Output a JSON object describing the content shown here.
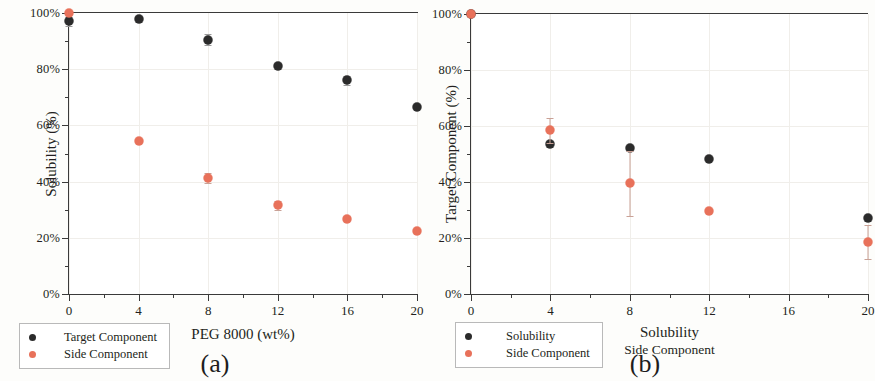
{
  "figure": {
    "panels": [
      {
        "key": "a",
        "caption": "(a)",
        "ylabel": "Solubility (%)",
        "xlabel": "PEG 8000 (wt%)",
        "xlabel_sub": ""
      },
      {
        "key": "b",
        "caption": "(b)",
        "ylabel": "Target Component (%)",
        "xlabel": "Solubility",
        "xlabel_sub": "Side Component"
      }
    ]
  },
  "chart_data": [
    {
      "type": "scatter",
      "panel": "a",
      "title": "",
      "xlabel": "PEG 8000 (wt%)",
      "ylabel": "Solubility (%)",
      "xlim": [
        0,
        20
      ],
      "ylim": [
        0,
        100
      ],
      "xticks": [
        0,
        4,
        8,
        12,
        16,
        20
      ],
      "xticklabels": [
        "0",
        "4",
        "8",
        "12",
        "16",
        "20"
      ],
      "yticks": [
        0,
        20,
        40,
        60,
        80,
        100
      ],
      "yticklabels": [
        "0%",
        "20%",
        "40%",
        "60%",
        "80%",
        "100%"
      ],
      "grid": true,
      "legend_position": "lower-left",
      "x": [
        0,
        4,
        8,
        12,
        16,
        20
      ],
      "series": [
        {
          "name": "Target Component",
          "color": "#2b2b2b",
          "values": [
            97.0,
            97.8,
            90.5,
            81.2,
            76.0,
            66.5
          ],
          "errors": [
            1.5,
            1.0,
            2.0,
            1.0,
            1.5,
            0.8
          ]
        },
        {
          "name": "Side Component",
          "color": "#e8715a",
          "values": [
            100.0,
            54.5,
            41.3,
            31.5,
            26.8,
            22.4
          ],
          "errors": [
            0.8,
            0.8,
            1.8,
            1.5,
            0.8,
            0.8
          ]
        }
      ]
    },
    {
      "type": "scatter",
      "panel": "b",
      "title": "",
      "xlabel": "Solubility",
      "xlabel_sub": "Side Component",
      "ylabel": "Target Component (%)",
      "xlim": [
        0,
        20
      ],
      "ylim": [
        0,
        100
      ],
      "xticks": [
        0,
        4,
        8,
        12,
        16,
        20
      ],
      "xticklabels": [
        "0",
        "4",
        "8",
        "12",
        "16",
        "20"
      ],
      "yticks": [
        0,
        20,
        40,
        60,
        80,
        100
      ],
      "yticklabels": [
        "0%",
        "20%",
        "40%",
        "60%",
        "80%",
        "100%"
      ],
      "grid": true,
      "legend_position": "lower-left",
      "x": [
        0,
        4,
        8,
        12,
        16,
        20
      ],
      "series": [
        {
          "name": "Solubility",
          "color": "#2b2b2b",
          "values": [
            100.0,
            53.5,
            52.0,
            48.2,
            null,
            27.0
          ],
          "errors": [
            0.5,
            1.0,
            0.5,
            0.5,
            null,
            1.0
          ]
        },
        {
          "name": "Side Component",
          "color": "#e8715a",
          "values": [
            100.0,
            58.5,
            39.5,
            29.6,
            null,
            18.5
          ],
          "errors": [
            0.5,
            4.5,
            11.5,
            0.5,
            null,
            6.0
          ]
        }
      ]
    }
  ],
  "legends": {
    "a": {
      "items": [
        {
          "label": "Target Component",
          "color": "#2b2b2b"
        },
        {
          "label": "Side Component",
          "color": "#e8715a"
        }
      ]
    },
    "b": {
      "items": [
        {
          "label": "Solubility",
          "color": "#2b2b2b"
        },
        {
          "label": "Side Component",
          "color": "#e8715a"
        }
      ]
    }
  },
  "colors": {
    "target": "#2b2b2b",
    "side": "#e8715a",
    "axis": "#3a3a3a",
    "grid": "#f0eeea",
    "background": "#fdfdfb"
  }
}
